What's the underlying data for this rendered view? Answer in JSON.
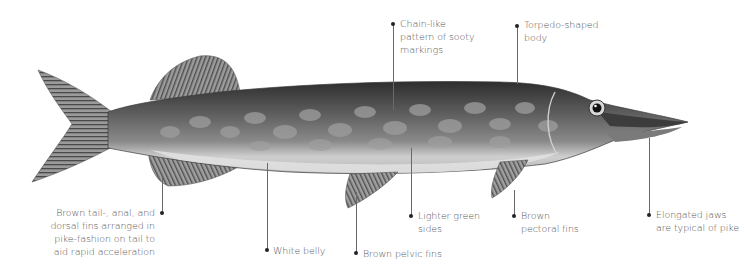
{
  "diagram": {
    "subject": "Pike",
    "palette": {
      "background": "#ffffff",
      "label_text": "#555555",
      "leader_line": "#6a6a6a",
      "leader_dot": "#222222",
      "body_dark": "#3a3a3a",
      "body_mid": "#7a7a7a",
      "belly": "#d8d8d8",
      "fin": "#8a8a8a"
    },
    "callouts": [
      {
        "id": "chain-pattern",
        "lines": [
          "Chain-like",
          "pattern of sooty",
          "markings"
        ]
      },
      {
        "id": "torpedo-body",
        "lines": [
          "Torpedo-shaped",
          "body"
        ]
      },
      {
        "id": "tail-fins",
        "lines": [
          "Brown tail-, anal, and",
          "dorsal fins arranged in",
          "pike-fashion on tail to",
          "aid rapid acceleration"
        ]
      },
      {
        "id": "white-belly",
        "lines": [
          "White belly"
        ]
      },
      {
        "id": "pelvic-fins",
        "lines": [
          "Brown pelvic fins"
        ]
      },
      {
        "id": "green-sides",
        "lines": [
          "Lighter green",
          "sides"
        ]
      },
      {
        "id": "pectoral-fins",
        "lines": [
          "Brown",
          "pectoral fins"
        ]
      },
      {
        "id": "jaws",
        "lines": [
          "Elongated jaws",
          "are typical of pike"
        ]
      }
    ]
  }
}
